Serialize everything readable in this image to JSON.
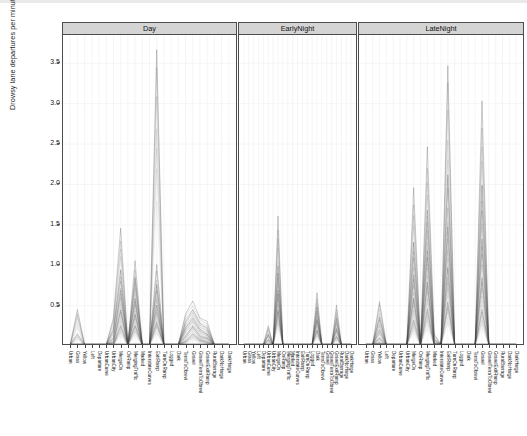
{
  "axes": {
    "ylabel": "Drowsy lane departures per minute",
    "yticks": [
      "0.5",
      "1.0",
      "1.5",
      "2.0",
      "2.5",
      "3.0",
      "3.5"
    ]
  },
  "panels": [
    {
      "label": "Day"
    },
    {
      "label": "EarlyNight"
    },
    {
      "label": "LateNight"
    }
  ],
  "chart_data": {
    "type": "line",
    "title": "",
    "subtitle": "",
    "xlabel": "",
    "ylabel": "Drowsy lane departures per minute",
    "ylim": [
      0,
      3.85
    ],
    "grid": true,
    "legend": null,
    "facet_variable": "TimeOfDay",
    "facets": [
      "Day",
      "EarlyNight",
      "LateNight"
    ],
    "categories": [
      "Urban",
      "Grass",
      "Yellow",
      "Left",
      "Departure",
      "UrbanCurve",
      "UrbanCity",
      "MergeOn",
      "OnRamp",
      "MergingTraffic",
      "Marked",
      "InterstateCurves",
      "ExitRamp",
      "TurnOnRamp",
      "Logged",
      "Dark",
      "TerraToObrevi",
      "Gravel",
      "GravelTerraToObrevi",
      "GravelExitRamp",
      "RuralBarrage",
      "DarkNoHarge",
      "DarkHarge"
    ],
    "series": [
      {
        "name": "Day",
        "facet": "Day",
        "values": [
          0.02,
          0.45,
          0.02,
          0.02,
          0.02,
          0.02,
          0.35,
          1.45,
          0.02,
          1.05,
          0.02,
          0.02,
          3.7,
          0.02,
          0.02,
          0.02,
          0.4,
          0.55,
          0.35,
          0.3,
          0.02,
          0.02,
          0.02
        ]
      },
      {
        "name": "Day2",
        "facet": "Day",
        "values": [
          0.02,
          0.02,
          0.02,
          0.02,
          0.02,
          0.02,
          0.2,
          0.95,
          0.02,
          0.85,
          0.02,
          0.02,
          1.0,
          0.02,
          0.02,
          0.02,
          0.3,
          0.45,
          0.28,
          0.22,
          0.02,
          0.02,
          0.02
        ]
      },
      {
        "name": "Day3",
        "facet": "Day",
        "values": [
          0.02,
          0.02,
          0.02,
          0.02,
          0.02,
          0.02,
          0.1,
          0.7,
          0.02,
          0.6,
          0.02,
          0.02,
          0.75,
          0.02,
          0.02,
          0.02,
          0.22,
          0.35,
          0.2,
          0.15,
          0.02,
          0.02,
          0.02
        ]
      },
      {
        "name": "Day4",
        "facet": "Day",
        "values": [
          0.02,
          0.02,
          0.02,
          0.02,
          0.02,
          0.02,
          0.05,
          0.45,
          0.02,
          0.4,
          0.02,
          0.02,
          0.5,
          0.02,
          0.02,
          0.02,
          0.12,
          0.25,
          0.12,
          0.1,
          0.02,
          0.02,
          0.02
        ]
      },
      {
        "name": "Day5",
        "facet": "Day",
        "values": [
          0.02,
          0.15,
          0.02,
          0.02,
          0.02,
          0.02,
          0.02,
          0.25,
          0.02,
          0.25,
          0.02,
          0.02,
          0.3,
          0.02,
          0.02,
          0.02,
          0.06,
          0.15,
          0.08,
          0.05,
          0.02,
          0.02,
          0.02
        ]
      },
      {
        "name": "EarlyNight",
        "facet": "EarlyNight",
        "values": [
          0.02,
          0.02,
          0.02,
          0.02,
          0.02,
          0.25,
          0.02,
          1.6,
          0.02,
          0.02,
          0.02,
          0.02,
          0.02,
          0.02,
          0.02,
          0.65,
          0.02,
          0.02,
          0.02,
          0.5,
          0.02,
          0.02,
          0.02
        ]
      },
      {
        "name": "EarlyNight2",
        "facet": "EarlyNight",
        "values": [
          0.02,
          0.02,
          0.02,
          0.02,
          0.02,
          0.15,
          0.02,
          1.0,
          0.02,
          0.02,
          0.02,
          0.02,
          0.02,
          0.02,
          0.02,
          0.48,
          0.02,
          0.02,
          0.02,
          0.35,
          0.02,
          0.02,
          0.02
        ]
      },
      {
        "name": "EarlyNight3",
        "facet": "EarlyNight",
        "values": [
          0.02,
          0.02,
          0.02,
          0.02,
          0.02,
          0.08,
          0.02,
          0.7,
          0.02,
          0.02,
          0.02,
          0.02,
          0.02,
          0.02,
          0.02,
          0.34,
          0.02,
          0.02,
          0.02,
          0.22,
          0.02,
          0.02,
          0.02
        ]
      },
      {
        "name": "EarlyNight4",
        "facet": "EarlyNight",
        "values": [
          0.02,
          0.02,
          0.02,
          0.02,
          0.02,
          0.02,
          0.02,
          0.45,
          0.02,
          0.02,
          0.02,
          0.02,
          0.02,
          0.02,
          0.02,
          0.2,
          0.02,
          0.02,
          0.02,
          0.12,
          0.02,
          0.02,
          0.02
        ]
      },
      {
        "name": "LateNight",
        "facet": "LateNight",
        "values": [
          0.02,
          0.02,
          0.55,
          0.02,
          0.02,
          0.02,
          0.02,
          1.95,
          0.02,
          2.45,
          0.15,
          0.02,
          3.5,
          0.02,
          0.02,
          0.02,
          0.02,
          3.0,
          0.02,
          0.02,
          0.02,
          0.02,
          0.02
        ]
      },
      {
        "name": "LateNight2",
        "facet": "LateNight",
        "values": [
          0.02,
          0.02,
          0.35,
          0.02,
          0.02,
          0.02,
          0.02,
          1.3,
          0.02,
          1.7,
          0.08,
          0.02,
          2.1,
          0.02,
          0.02,
          0.02,
          0.02,
          2.0,
          0.02,
          0.02,
          0.02,
          0.02,
          0.02
        ]
      },
      {
        "name": "LateNight3",
        "facet": "LateNight",
        "values": [
          0.02,
          0.02,
          0.2,
          0.02,
          0.02,
          0.02,
          0.02,
          0.9,
          0.02,
          1.2,
          0.04,
          0.02,
          1.45,
          0.02,
          0.02,
          0.02,
          0.02,
          1.35,
          0.02,
          0.02,
          0.02,
          0.02,
          0.02
        ]
      },
      {
        "name": "LateNight4",
        "facet": "LateNight",
        "values": [
          0.02,
          0.02,
          0.1,
          0.02,
          0.02,
          0.02,
          0.02,
          0.6,
          0.02,
          0.8,
          0.02,
          0.02,
          0.95,
          0.02,
          0.02,
          0.02,
          0.02,
          0.85,
          0.02,
          0.02,
          0.02,
          0.02,
          0.02
        ]
      },
      {
        "name": "LateNight5",
        "facet": "LateNight",
        "values": [
          0.02,
          0.02,
          0.04,
          0.02,
          0.02,
          0.02,
          0.02,
          0.32,
          0.02,
          0.45,
          0.02,
          0.02,
          0.55,
          0.02,
          0.02,
          0.02,
          0.02,
          0.45,
          0.02,
          0.02,
          0.02,
          0.02,
          0.02
        ]
      }
    ]
  }
}
